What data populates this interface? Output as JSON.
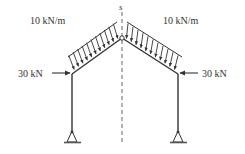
{
  "diagram": {
    "section_label": "s",
    "left_load": {
      "label": "10 kN/m",
      "arrow_count": 11
    },
    "right_load": {
      "label": "10 kN/m",
      "arrow_count": 11
    },
    "left_force": {
      "label": "30 kN",
      "direction": "right"
    },
    "right_force": {
      "label": "30 kN",
      "direction": "left"
    },
    "supports": [
      "pin",
      "pin"
    ],
    "hinge": "apex",
    "colors": {
      "stroke": "#333333",
      "dash": "#555555"
    }
  }
}
